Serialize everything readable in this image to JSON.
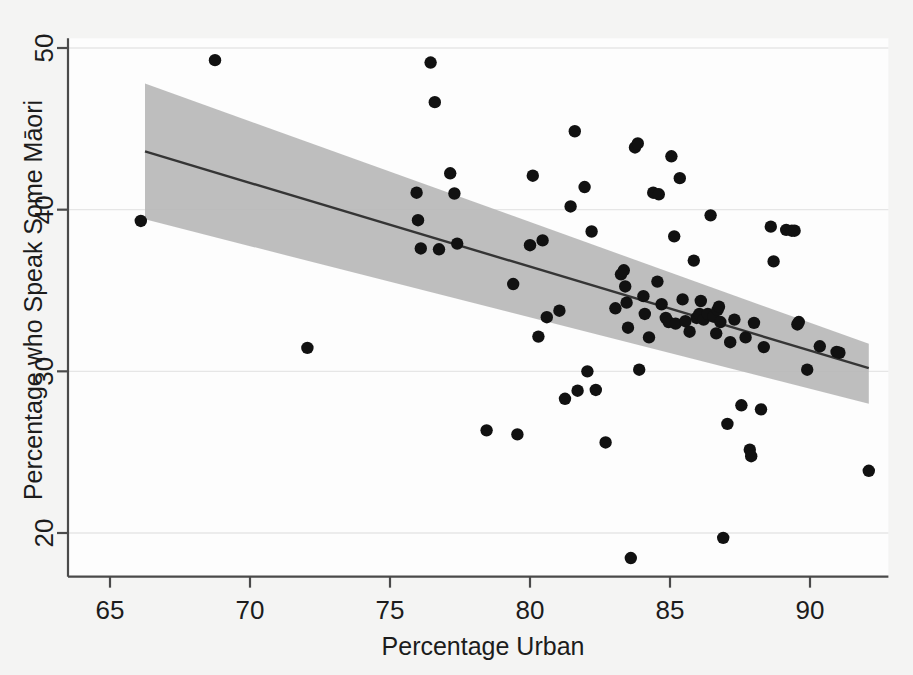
{
  "chart_data": {
    "type": "scatter",
    "title": "",
    "subtitle": "",
    "xlabel": "Percentage Urban",
    "ylabel": "Percentage who Speak Some Māori",
    "xlim": [
      63.5,
      92.8
    ],
    "ylim": [
      17.3,
      50.6
    ],
    "xticks": [
      65,
      70,
      75,
      80,
      85,
      90
    ],
    "xtick_labels": [
      "65",
      "70",
      "75",
      "80",
      "85",
      "90"
    ],
    "yticks": [
      20,
      30,
      40,
      50
    ],
    "ytick_labels": [
      "20",
      "30",
      "40",
      "50"
    ],
    "grid": true,
    "grid_axis": "y",
    "legend": "none",
    "marker": "filled-circle",
    "marker_color": "#111111",
    "point_count": 92,
    "points": [
      [
        66.1,
        39.3
      ],
      [
        68.75,
        49.25
      ],
      [
        72.05,
        31.45
      ],
      [
        75.95,
        41.05
      ],
      [
        76.0,
        39.35
      ],
      [
        76.1,
        37.6
      ],
      [
        76.45,
        49.1
      ],
      [
        76.6,
        46.65
      ],
      [
        76.75,
        37.55
      ],
      [
        77.15,
        42.25
      ],
      [
        77.3,
        41.0
      ],
      [
        77.4,
        37.9
      ],
      [
        78.45,
        26.35
      ],
      [
        79.4,
        35.4
      ],
      [
        79.55,
        26.1
      ],
      [
        80.0,
        37.8
      ],
      [
        80.1,
        42.1
      ],
      [
        80.3,
        32.15
      ],
      [
        80.45,
        38.1
      ],
      [
        80.6,
        33.35
      ],
      [
        81.05,
        33.75
      ],
      [
        81.25,
        28.3
      ],
      [
        81.45,
        40.2
      ],
      [
        81.6,
        44.85
      ],
      [
        81.7,
        28.8
      ],
      [
        81.95,
        41.4
      ],
      [
        82.05,
        30.0
      ],
      [
        82.2,
        38.65
      ],
      [
        82.35,
        28.85
      ],
      [
        82.7,
        25.6
      ],
      [
        83.05,
        33.9
      ],
      [
        83.25,
        36.0
      ],
      [
        83.35,
        36.25
      ],
      [
        83.4,
        35.25
      ],
      [
        83.45,
        34.25
      ],
      [
        83.5,
        32.7
      ],
      [
        83.6,
        18.45
      ],
      [
        83.75,
        43.85
      ],
      [
        83.85,
        44.1
      ],
      [
        83.9,
        30.1
      ],
      [
        84.05,
        34.65
      ],
      [
        84.1,
        33.55
      ],
      [
        84.25,
        32.1
      ],
      [
        84.4,
        41.05
      ],
      [
        84.55,
        35.55
      ],
      [
        84.6,
        40.95
      ],
      [
        84.7,
        34.15
      ],
      [
        84.85,
        33.3
      ],
      [
        84.95,
        33.05
      ],
      [
        85.05,
        43.3
      ],
      [
        85.15,
        38.35
      ],
      [
        85.2,
        32.95
      ],
      [
        85.35,
        41.95
      ],
      [
        85.45,
        34.45
      ],
      [
        85.55,
        33.1
      ],
      [
        85.7,
        32.45
      ],
      [
        85.85,
        36.85
      ],
      [
        85.95,
        33.3
      ],
      [
        86.05,
        33.55
      ],
      [
        86.1,
        34.35
      ],
      [
        86.2,
        33.2
      ],
      [
        86.35,
        33.55
      ],
      [
        86.45,
        39.65
      ],
      [
        86.55,
        33.4
      ],
      [
        86.65,
        32.35
      ],
      [
        86.7,
        33.8
      ],
      [
        86.75,
        34.0
      ],
      [
        86.8,
        33.05
      ],
      [
        86.9,
        19.7
      ],
      [
        87.05,
        26.75
      ],
      [
        87.15,
        31.8
      ],
      [
        87.3,
        33.2
      ],
      [
        87.55,
        27.9
      ],
      [
        87.7,
        32.1
      ],
      [
        87.85,
        25.15
      ],
      [
        87.9,
        24.75
      ],
      [
        88.0,
        33.0
      ],
      [
        88.25,
        27.65
      ],
      [
        88.35,
        31.5
      ],
      [
        88.6,
        38.95
      ],
      [
        88.7,
        36.8
      ],
      [
        89.15,
        38.75
      ],
      [
        89.35,
        38.7
      ],
      [
        89.45,
        38.7
      ],
      [
        89.55,
        32.9
      ],
      [
        89.6,
        33.05
      ],
      [
        89.9,
        30.1
      ],
      [
        90.35,
        31.55
      ],
      [
        90.95,
        31.2
      ],
      [
        91.05,
        31.15
      ],
      [
        92.1,
        23.85
      ]
    ],
    "fit_line": {
      "name": "linear fit",
      "x": [
        66.25,
        92.1
      ],
      "y": [
        43.6,
        30.2
      ],
      "color": "#353535"
    },
    "confidence_band": {
      "name": "95% confidence interval",
      "color": "#b9b9b9",
      "x": [
        66.25,
        92.1
      ],
      "upper": [
        47.8,
        31.7
      ],
      "lower": [
        39.4,
        28.0
      ]
    }
  }
}
